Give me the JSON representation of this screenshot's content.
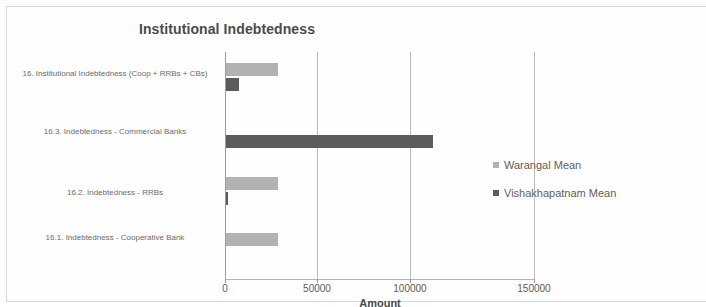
{
  "chart_data": {
    "type": "bar",
    "orientation": "horizontal",
    "title": "Institutional Indebtedness",
    "xlabel": "Amount",
    "ylabel": "",
    "xlim": [
      0,
      150000
    ],
    "xticks": [
      "0",
      "50000",
      "100000",
      "150000"
    ],
    "xtick_values": [
      0,
      50000,
      100000,
      150000
    ],
    "grid": "vertical",
    "legend_position": "right",
    "categories": [
      "16. Institutional Indebtedness (Coop + RRBs + CBs)",
      "16.3. Indebtedness - Commercial Banks",
      "16.2. Indebtedness - RRBs",
      "16.1. Indebtedness - Cooperative Bank"
    ],
    "series": [
      {
        "name": "Warangal Mean",
        "color": "#b2b2b2",
        "values": [
          25000,
          0,
          25000,
          25000
        ]
      },
      {
        "name": "Vishakhapatnam Mean",
        "color": "#5c5c5c",
        "values": [
          6500,
          100000,
          900,
          0
        ]
      }
    ]
  },
  "legend": {
    "items": [
      {
        "label": "Warangal Mean",
        "color": "#b2b2b2",
        "marker": "square-marker"
      },
      {
        "label": "Vishakhapatnam Mean",
        "color": "#5c5c5c",
        "marker": "square-marker"
      }
    ]
  }
}
